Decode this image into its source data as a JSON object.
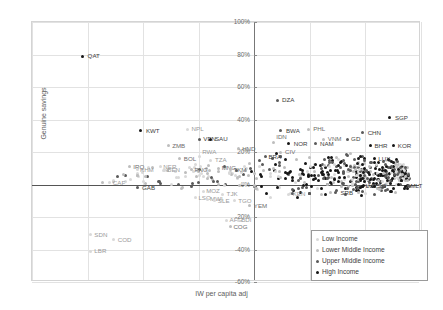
{
  "chart_data": {
    "type": "scatter",
    "title": "",
    "xlabel": "IW per capita adj",
    "ylabel": "Genuine savings",
    "ylim": [
      -60,
      100
    ],
    "yticks": [
      "100%",
      "80%",
      "60%",
      "40%",
      "20%",
      "0%",
      "-20%",
      "-40%",
      "-60%"
    ],
    "ytick_values": [
      100,
      80,
      60,
      40,
      20,
      0,
      -20,
      -40,
      -60
    ],
    "xticks": [],
    "grid": true,
    "legend_position": "bottom-right",
    "legend": [
      {
        "label": "Low Income",
        "color": "#d9d9d9",
        "key": "low"
      },
      {
        "label": "Lower Middle Income",
        "color": "#bdbdbd",
        "key": "lowmid"
      },
      {
        "label": "Upper Middle Income",
        "color": "#5a5a5a",
        "key": "uppmid"
      },
      {
        "label": "High Income",
        "color": "#161616",
        "key": "high"
      }
    ],
    "points": [
      {
        "code": "QAT",
        "x": 13,
        "y": 79,
        "g": "high",
        "lx": 5,
        "ly": -3
      },
      {
        "code": "DZA",
        "x": 63,
        "y": 52,
        "g": "uppmid",
        "lx": 5,
        "ly": -3
      },
      {
        "code": "SGP",
        "x": 92,
        "y": 41,
        "g": "high",
        "lx": 5,
        "ly": -3
      },
      {
        "code": "KWT",
        "x": 28,
        "y": 33,
        "g": "high",
        "lx": 5,
        "ly": -3
      },
      {
        "code": "NPL",
        "x": 40,
        "y": 34,
        "g": "low",
        "lx": 4,
        "ly": -3
      },
      {
        "code": "BWA",
        "x": 64,
        "y": 33,
        "g": "uppmid",
        "lx": 5,
        "ly": -3
      },
      {
        "code": "PHL",
        "x": 71,
        "y": 34,
        "g": "lowmid",
        "lx": 5,
        "ly": -3
      },
      {
        "code": "CHN",
        "x": 85,
        "y": 32,
        "g": "uppmid",
        "lx": 5,
        "ly": -3
      },
      {
        "code": "VEN",
        "x": 43,
        "y": 28,
        "g": "uppmid",
        "lx": 4,
        "ly": -3
      },
      {
        "code": "SAU",
        "x": 46,
        "y": 28,
        "g": "high",
        "lx": 4,
        "ly": -3
      },
      {
        "code": "VNM",
        "x": 75,
        "y": 28,
        "g": "lowmid",
        "lx": 4,
        "ly": -3
      },
      {
        "code": "GD",
        "x": 81,
        "y": 28,
        "g": "uppmid",
        "lx": 4,
        "ly": -3
      },
      {
        "code": "ZMB",
        "x": 35,
        "y": 24,
        "g": "lowmid",
        "lx": 4,
        "ly": -3
      },
      {
        "code": "NOR",
        "x": 66,
        "y": 25,
        "g": "high",
        "lx": 5,
        "ly": -3
      },
      {
        "code": "IDN",
        "x": 62,
        "y": 26,
        "g": "lowmid",
        "lx": 3,
        "ly": -8
      },
      {
        "code": "NAM",
        "x": 73,
        "y": 25,
        "g": "uppmid",
        "lx": 4,
        "ly": -3
      },
      {
        "code": "BHR",
        "x": 87,
        "y": 24,
        "g": "high",
        "lx": 4,
        "ly": -3
      },
      {
        "code": "KOR",
        "x": 93,
        "y": 24,
        "g": "high",
        "lx": 4,
        "ly": -3
      },
      {
        "code": "HND",
        "x": 53,
        "y": 22,
        "g": "lowmid",
        "lx": 4,
        "ly": -3
      },
      {
        "code": "CIV",
        "x": 64,
        "y": 20,
        "g": "lowmid",
        "lx": 4,
        "ly": -3
      },
      {
        "code": "BOL",
        "x": 38,
        "y": 16,
        "g": "lowmid",
        "lx": 4,
        "ly": -3
      },
      {
        "code": "TZA",
        "x": 46,
        "y": 15,
        "g": "low",
        "lx": 4,
        "ly": -3
      },
      {
        "code": "RWA",
        "x": 43,
        "y": 17,
        "g": "low",
        "lx": 3,
        "ly": -8
      },
      {
        "code": "BRA",
        "x": 60,
        "y": 17,
        "g": "uppmid",
        "lx": 3,
        "ly": -3
      },
      {
        "code": "LUX",
        "x": 88,
        "y": 16,
        "g": "high",
        "lx": 4,
        "ly": -3
      },
      {
        "code": "IRQ",
        "x": 25,
        "y": 11,
        "g": "lowmid",
        "lx": 4,
        "ly": -3
      },
      {
        "code": "KHM",
        "x": 27,
        "y": 9,
        "g": "low",
        "lx": 3,
        "ly": -3
      },
      {
        "code": "NER",
        "x": 33,
        "y": 11,
        "g": "low",
        "lx": 3,
        "ly": -3
      },
      {
        "code": "BEN",
        "x": 34,
        "y": 9,
        "g": "low",
        "lx": 3,
        "ly": -3
      },
      {
        "code": "PNG",
        "x": 41,
        "y": 9,
        "g": "lowmid",
        "lx": 3,
        "ly": -3
      },
      {
        "code": "MNG",
        "x": 48,
        "y": 10,
        "g": "lowmid",
        "lx": 3,
        "ly": -3
      },
      {
        "code": "TKM",
        "x": 51,
        "y": 9,
        "g": "lowmid",
        "lx": 3,
        "ly": -3
      },
      {
        "code": "CAF",
        "x": 20,
        "y": 1,
        "g": "low",
        "lx": 3,
        "ly": -3
      },
      {
        "code": "GAB",
        "x": 27,
        "y": -2,
        "g": "uppmid",
        "lx": 5,
        "ly": -3
      },
      {
        "code": "MOZ",
        "x": 44,
        "y": -4,
        "g": "low",
        "lx": 3,
        "ly": -3
      },
      {
        "code": "TJK",
        "x": 49,
        "y": -6,
        "g": "low",
        "lx": 4,
        "ly": -3
      },
      {
        "code": "LSO",
        "x": 42,
        "y": -8,
        "g": "low",
        "lx": 3,
        "ly": -3
      },
      {
        "code": "MWI",
        "x": 45,
        "y": -9,
        "g": "low",
        "lx": 3,
        "ly": -3
      },
      {
        "code": "SLE",
        "x": 47,
        "y": -10,
        "g": "low",
        "lx": 3,
        "ly": -3
      },
      {
        "code": "TGO",
        "x": 52,
        "y": -10,
        "g": "low",
        "lx": 4,
        "ly": -3
      },
      {
        "code": "YEM",
        "x": 56,
        "y": -13,
        "g": "lowmid",
        "lx": 4,
        "ly": -3
      },
      {
        "code": "KEN",
        "x": 66,
        "y": -6,
        "g": "low",
        "lx": 4,
        "ly": -3
      },
      {
        "code": "SRB",
        "x": 78,
        "y": -5,
        "g": "uppmid",
        "lx": 5,
        "ly": -3
      },
      {
        "code": "LVA",
        "x": 85,
        "y": -1,
        "g": "high",
        "lx": 3,
        "ly": -3
      },
      {
        "code": "SO",
        "x": 88,
        "y": -1,
        "g": "high",
        "lx": 3,
        "ly": -3
      },
      {
        "code": "MLT",
        "x": 96,
        "y": -1,
        "g": "high",
        "lx": 5,
        "ly": -3
      },
      {
        "code": "AFG",
        "x": 50,
        "y": -22,
        "g": "low",
        "lx": 3,
        "ly": -3
      },
      {
        "code": "BDI",
        "x": 53,
        "y": -22,
        "g": "low",
        "lx": 3,
        "ly": -3
      },
      {
        "code": "COG",
        "x": 51,
        "y": -26,
        "g": "lowmid",
        "lx": 3,
        "ly": -3
      },
      {
        "code": "SDN",
        "x": 15,
        "y": -31,
        "g": "low",
        "lx": 4,
        "ly": -3
      },
      {
        "code": "COD",
        "x": 21,
        "y": -34,
        "g": "low",
        "lx": 4,
        "ly": -3
      },
      {
        "code": "LBR",
        "x": 15,
        "y": -41,
        "g": "low",
        "lx": 4,
        "ly": -3
      }
    ],
    "cluster_note": "dense unlabeled cluster of country points between x 55-95, y -8 to 30"
  }
}
